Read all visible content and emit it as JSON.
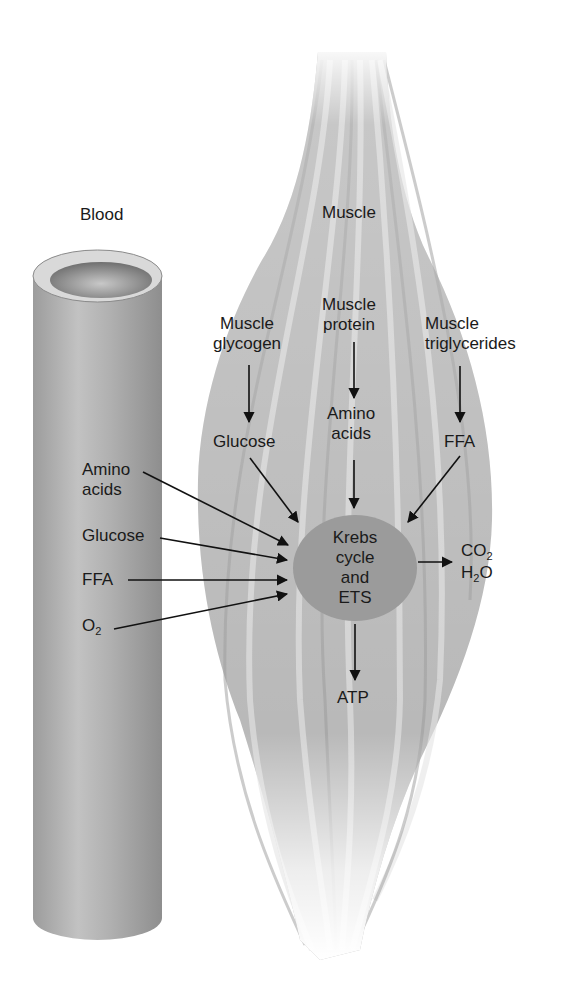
{
  "labels": {
    "blood": "Blood",
    "muscle": "Muscle",
    "muscle_glycogen_1": "Muscle",
    "muscle_glycogen_2": "glycogen",
    "muscle_protein_1": "Muscle",
    "muscle_protein_2": "protein",
    "muscle_trig_1": "Muscle",
    "muscle_trig_2": "triglycerides",
    "glucose_muscle": "Glucose",
    "amino_muscle_1": "Amino",
    "amino_muscle_2": "acids",
    "ffa_muscle": "FFA",
    "blood_amino_1": "Amino",
    "blood_amino_2": "acids",
    "blood_glucose": "Glucose",
    "blood_ffa": "FFA",
    "blood_o2_base": "O",
    "blood_o2_sub": "2",
    "krebs_1": "Krebs",
    "krebs_2": "cycle",
    "krebs_3": "and",
    "krebs_4": "ETS",
    "co2_base": "CO",
    "co2_sub": "2",
    "h2o_h": "H",
    "h2o_sub": "2",
    "h2o_o": "O",
    "atp": "ATP"
  },
  "colors": {
    "tube": "#a9a9a9",
    "tube_light": "#c4c4c4",
    "muscle": "#b8b8b8",
    "circle": "#9a9a9a",
    "arrow": "#111111"
  }
}
